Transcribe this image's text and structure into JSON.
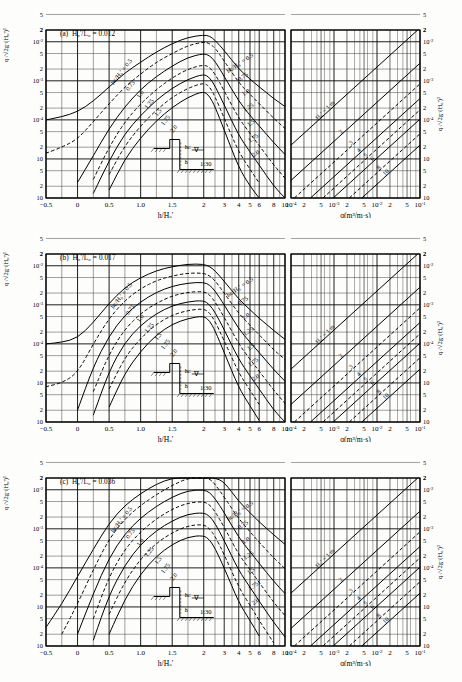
{
  "figure": {
    "title_note": "Overtopping rate design diagrams for vertical seawall on 1:30 bottom slope",
    "panels": [
      {
        "tag": "(a)",
        "param_label": "H₀'/L₀ = 0.012",
        "steepness": 0.012
      },
      {
        "tag": "(b)",
        "param_label": "H₀'/L₀ = 0.017",
        "steepness": 0.017
      },
      {
        "tag": "(c)",
        "param_label": "H₀'/L₀ = 0.036",
        "steepness": 0.036
      }
    ],
    "axes": {
      "left_y_label": "q /√2g·(H₀')³",
      "right_y_label": "q /√2g·(H₀')³",
      "left_x_label": "h/H₀'",
      "right_x_label": "q(m³/m·s)",
      "y_ticks": [
        "2",
        "10⁻²",
        "5",
        "2",
        "10⁻³",
        "5",
        "2",
        "10⁻⁴",
        "5",
        "2",
        "10⁻⁵",
        "5",
        "2",
        "10⁻⁶"
      ],
      "y_major": [
        "10⁻²",
        "10⁻³",
        "10⁻⁴",
        "10⁻⁵",
        "10⁻⁶"
      ],
      "y_range": [
        1e-06,
        0.02
      ],
      "left_x_ticks_linear": [
        "-0.5",
        "0",
        "0.5",
        "1.0",
        "1.5",
        "2"
      ],
      "left_x_ticks_log": [
        "3",
        "4",
        "5",
        "6",
        "8",
        "10"
      ],
      "right_x_ticks": [
        "10⁻⁴",
        "2",
        "5",
        "10⁻³",
        "2",
        "5",
        "10⁻²",
        "2",
        "5",
        "10⁻¹"
      ],
      "right_x_range": [
        0.0001,
        0.1
      ]
    },
    "curve_family": {
      "label": "hᴄ/H₀′ =",
      "first_label": "hᴄ/H₀′ = 0.5",
      "values": [
        "0.5",
        "0.75",
        "1.0",
        "1.25",
        "1.5",
        "1.75",
        "2.0"
      ],
      "line_styles": [
        "solid",
        "dashed",
        "solid",
        "dashed",
        "solid",
        "dashed",
        "solid"
      ]
    },
    "nomograph": {
      "label": "H₀′ = 1 m",
      "values": [
        "1 m",
        "2",
        "3",
        "4",
        "5",
        "6",
        "8",
        "10"
      ],
      "line_styles": [
        "solid",
        "solid",
        "dashed",
        "solid",
        "dashed",
        "solid",
        "dashed",
        "solid"
      ]
    },
    "inset": {
      "crest_label": "hᴄ",
      "depth_label": "h",
      "slope_label": "1:30",
      "swl_symbol": "∇"
    }
  },
  "chart_data": {
    "type": "line",
    "xlabel": "h/H₀'",
    "ylabel": "q /√2g·(H₀')³",
    "ylim": [
      1e-06,
      0.02
    ],
    "xlim": [
      -0.5,
      10
    ],
    "grid": true,
    "legend": "inline curve labels",
    "panels": [
      {
        "name": "(a) H₀'/L₀ = 0.012",
        "x": [
          -0.5,
          -0.25,
          0,
          0.25,
          0.5,
          0.75,
          1.0,
          1.25,
          1.5,
          1.75,
          2.0,
          2.25,
          2.5,
          3.0,
          4.0,
          5.0,
          6.0,
          8.0,
          10.0
        ],
        "series": [
          {
            "name": "hc/H0'=0.5",
            "values": [
              0.0001,
              0.00012,
              0.00016,
              0.0003,
              0.0007,
              0.0016,
              0.003,
              0.0055,
              0.009,
              0.013,
              0.015,
              0.014,
              0.011,
              0.006,
              0.002,
              0.0011,
              0.0007,
              0.00035,
              0.00022
            ]
          },
          {
            "name": "hc/H0'=0.75",
            "values": [
              1.4e-05,
              2e-05,
              3.2e-05,
              9e-05,
              0.00026,
              0.0007,
              0.0015,
              0.003,
              0.005,
              0.008,
              0.01,
              0.009,
              0.007,
              0.0032,
              0.0009,
              0.00045,
              0.00026,
              0.00011,
              6e-05
            ]
          },
          {
            "name": "hc/H0'=1.0",
            "values": [
              null,
              null,
              2.5e-06,
              1.2e-05,
              6e-05,
              0.00022,
              0.0006,
              0.0013,
              0.0024,
              0.004,
              0.005,
              0.0044,
              0.0032,
              0.0013,
              0.0003,
              0.00013,
              7e-05,
              2.6e-05,
              1.3e-05
            ]
          },
          {
            "name": "hc/H0'=1.25",
            "values": [
              null,
              null,
              null,
              3e-06,
              2e-05,
              9e-05,
              0.00026,
              0.0006,
              0.0012,
              0.002,
              0.0026,
              0.0022,
              0.0015,
              0.00055,
              0.00011,
              4.5e-05,
              2.2e-05,
              7e-06,
              3.2e-06
            ]
          },
          {
            "name": "hc/H0'=1.5",
            "values": [
              null,
              null,
              null,
              1.3e-06,
              9e-06,
              4.5e-05,
              0.00013,
              0.00032,
              0.00065,
              0.0011,
              0.0015,
              0.0012,
              0.00075,
              0.00024,
              4e-05,
              1.5e-05,
              7e-06,
              2e-06,
              1e-06
            ]
          },
          {
            "name": "hc/H0'=1.75",
            "values": [
              null,
              null,
              null,
              null,
              4e-06,
              2.2e-05,
              7e-05,
              0.00018,
              0.00038,
              0.00065,
              0.0009,
              0.0007,
              0.0004,
              0.00011,
              1.5e-05,
              5.5e-06,
              2.4e-06,
              null,
              null
            ]
          },
          {
            "name": "hc/H0'=2.0",
            "values": [
              null,
              null,
              null,
              null,
              1.6e-06,
              1e-05,
              3.5e-05,
              9.5e-05,
              0.00021,
              0.00038,
              0.00055,
              0.0004,
              0.00022,
              5.5e-05,
              6e-06,
              2e-06,
              1e-06,
              null,
              null
            ]
          }
        ]
      },
      {
        "name": "(b) H₀'/L₀ = 0.017",
        "x": [
          -0.5,
          -0.25,
          0,
          0.25,
          0.5,
          0.75,
          1.0,
          1.25,
          1.5,
          1.75,
          2.0,
          2.25,
          2.5,
          3.0,
          4.0,
          5.0,
          6.0,
          8.0,
          10.0
        ],
        "series": [
          {
            "name": "hc/H0'=0.5",
            "values": [
              0.0001,
              0.00011,
              0.00014,
              0.00035,
              0.0011,
              0.0028,
              0.005,
              0.0075,
              0.0095,
              0.011,
              0.011,
              0.0095,
              0.0075,
              0.004,
              0.0014,
              0.00075,
              0.00045,
              0.00022,
              0.00013
            ]
          },
          {
            "name": "hc/H0'=0.75",
            "values": [
              8e-06,
              1e-05,
              1.8e-05,
              0.0001,
              0.00045,
              0.0013,
              0.0026,
              0.0042,
              0.0055,
              0.0065,
              0.0065,
              0.0055,
              0.0042,
              0.002,
              0.0006,
              0.0003,
              0.00017,
              7e-05,
              4e-05
            ]
          },
          {
            "name": "hc/H0'=1.0",
            "values": [
              null,
              null,
              2e-06,
              2.6e-05,
              0.00016,
              0.00055,
              0.0012,
              0.0021,
              0.003,
              0.0036,
              0.0038,
              0.0032,
              0.0023,
              0.001,
              0.00024,
              0.00011,
              6e-05,
              2.2e-05,
              1.1e-05
            ]
          },
          {
            "name": "hc/H0'=1.25",
            "values": [
              null,
              null,
              null,
              6e-06,
              5.5e-05,
              0.00024,
              0.0006,
              0.0011,
              0.0017,
              0.0021,
              0.0022,
              0.0018,
              0.0012,
              0.00048,
              0.0001,
              4e-05,
              2e-05,
              6.5e-06,
              3e-06
            ]
          },
          {
            "name": "hc/H0'=1.5",
            "values": [
              null,
              null,
              null,
              1.5e-06,
              2e-05,
              0.00011,
              0.0003,
              0.0006,
              0.00095,
              0.0012,
              0.0013,
              0.001,
              0.00065,
              0.00023,
              4e-05,
              1.5e-05,
              7e-06,
              2e-06,
              1e-06
            ]
          },
          {
            "name": "hc/H0'=1.75",
            "values": [
              null,
              null,
              null,
              null,
              7e-06,
              4.5e-05,
              0.00014,
              0.00032,
              0.00055,
              0.00072,
              0.0008,
              0.00062,
              0.00038,
              0.00012,
              1.8e-05,
              6.5e-06,
              2.8e-06,
              null,
              null
            ]
          },
          {
            "name": "hc/H0'=2.0",
            "values": [
              null,
              null,
              null,
              null,
              2.4e-06,
              1.8e-05,
              6.5e-05,
              0.00017,
              0.00032,
              0.00045,
              0.00052,
              0.00039,
              0.00022,
              6e-05,
              7.5e-06,
              2.6e-06,
              1.1e-06,
              null,
              null
            ]
          }
        ]
      },
      {
        "name": "(c) H₀'/L₀ = 0.036",
        "x": [
          -0.5,
          -0.25,
          0,
          0.25,
          0.5,
          0.75,
          1.0,
          1.25,
          1.5,
          1.75,
          2.0,
          2.25,
          2.5,
          3.0,
          4.0,
          5.0,
          6.0,
          8.0,
          10.0
        ],
        "series": [
          {
            "name": "hc/H0'=0.5",
            "values": [
              3e-06,
              1.2e-05,
              6e-05,
              0.0003,
              0.0014,
              0.004,
              0.008,
              0.014,
              0.026,
              0.042,
              0.045,
              0.04,
              0.03,
              0.016,
              0.005,
              0.0026,
              0.0015,
              0.0007,
              0.0004
            ]
          },
          {
            "name": "hc/H0'=0.75",
            "values": [
              null,
              2e-06,
              1.2e-05,
              9e-05,
              0.00055,
              0.0018,
              0.004,
              0.0075,
              0.013,
              0.02,
              0.022,
              0.019,
              0.014,
              0.0065,
              0.0018,
              0.00085,
              0.00045,
              0.00018,
              9.5e-05
            ]
          },
          {
            "name": "hc/H0'=1.0",
            "values": [
              null,
              null,
              2e-06,
              2.2e-05,
              0.00018,
              0.00075,
              0.0019,
              0.0038,
              0.0065,
              0.0095,
              0.01,
              0.0085,
              0.006,
              0.0026,
              0.0006,
              0.00026,
              0.00013,
              4.5e-05,
              2.2e-05
            ]
          },
          {
            "name": "hc/H0'=1.25",
            "values": [
              null,
              null,
              null,
              5e-06,
              6e-05,
              0.0003,
              0.00085,
              0.0018,
              0.0032,
              0.0046,
              0.005,
              0.0041,
              0.0028,
              0.0011,
              0.00022,
              9e-05,
              4.2e-05,
              1.3e-05,
              6e-06
            ]
          },
          {
            "name": "hc/H0'=1.5",
            "values": [
              null,
              null,
              null,
              1.4e-06,
              2e-05,
              0.00012,
              0.0004,
              0.0009,
              0.0016,
              0.0024,
              0.0026,
              0.0021,
              0.0014,
              0.0005,
              8.5e-05,
              3.2e-05,
              1.4e-05,
              4e-06,
              1.7e-06
            ]
          },
          {
            "name": "hc/H0'=1.75",
            "values": [
              null,
              null,
              null,
              null,
              6.5e-06,
              4.5e-05,
              0.00017,
              0.00043,
              0.0008,
              0.0012,
              0.0013,
              0.001,
              0.00065,
              0.00022,
              3.2e-05,
              1.1e-05,
              4.5e-06,
              1.2e-06,
              null
            ]
          },
          {
            "name": "hc/H0'=2.0",
            "values": [
              null,
              null,
              null,
              null,
              2e-06,
              1.6e-05,
              7e-05,
              0.0002,
              0.0004,
              0.00062,
              0.00068,
              0.00052,
              0.00032,
              0.0001,
              1.3e-05,
              4.5e-06,
              1.8e-06,
              null,
              null
            ]
          }
        ]
      }
    ],
    "nomograph_panel": {
      "type": "line",
      "xlabel": "q(m³/m·s)",
      "ylabel": "q /√2g·(H₀')³",
      "xlim": [
        0.0001,
        0.1
      ],
      "ylim": [
        1e-06,
        0.02
      ],
      "description": "Parallel conversion lines of slope 1 in log-log for H₀' = 1,2,3,4,5,6,8,10 m",
      "series": [
        {
          "name": "H0'=1 m",
          "H0": 1
        },
        {
          "name": "H0'=2",
          "H0": 2
        },
        {
          "name": "H0'=3",
          "H0": 3
        },
        {
          "name": "H0'=4",
          "H0": 4
        },
        {
          "name": "H0'=5",
          "H0": 5
        },
        {
          "name": "H0'=6",
          "H0": 6
        },
        {
          "name": "H0'=8",
          "H0": 8
        },
        {
          "name": "H0'=10",
          "H0": 10
        }
      ]
    }
  }
}
